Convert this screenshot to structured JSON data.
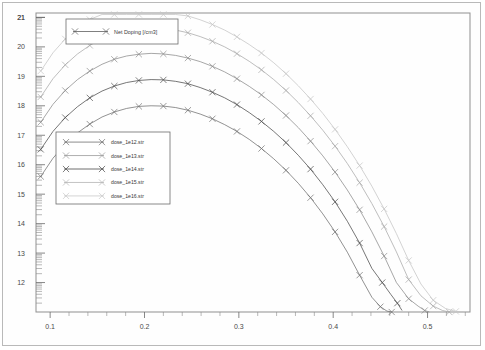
{
  "window": {
    "title": "Net Doping profile plot"
  },
  "legend_main": {
    "label": "Net Doping [/cm3]",
    "marker": "x-marker"
  },
  "legend_series": {
    "items": [
      {
        "label": "dose_1e12.str",
        "color": "#6e6e6e"
      },
      {
        "label": "dose_1e13.str",
        "color": "#9a9a9a"
      },
      {
        "label": "dose_1e14.str",
        "color": "#4a4a4a"
      },
      {
        "label": "dose_1e15.str",
        "color": "#b5b5b5"
      },
      {
        "label": "dose_1e16.str",
        "color": "#c9c9c9"
      }
    ]
  },
  "chart_data": {
    "type": "line",
    "title": "",
    "subtitle": "",
    "xlabel": "",
    "ylabel": "",
    "legend_title": "Net Doping [/cm3]",
    "legend_position": "upper-left-and-mid-left",
    "grid": false,
    "yscale": "log10-decades",
    "xlim": [
      0.085,
      0.545
    ],
    "ylim": [
      11.0,
      21.15
    ],
    "xticks": [
      0.1,
      0.2,
      0.3,
      0.4,
      0.5
    ],
    "xtick_labels": [
      "0.1",
      "0.2",
      "0.3",
      "0.4",
      "0.5"
    ],
    "yticks": [
      12,
      13,
      14,
      15,
      16,
      17,
      18,
      19,
      20,
      21
    ],
    "ytick_labels": [
      "12",
      "13",
      "14",
      "15",
      "16",
      "17",
      "18",
      "19",
      "20",
      "21"
    ],
    "marker": "x",
    "series": [
      {
        "name": "dose_1e12.str",
        "color": "#4a4a4a",
        "x": [
          0.09,
          0.103,
          0.116,
          0.129,
          0.142,
          0.155,
          0.168,
          0.181,
          0.194,
          0.207,
          0.22,
          0.233,
          0.246,
          0.259,
          0.272,
          0.285,
          0.298,
          0.311,
          0.324,
          0.337,
          0.35,
          0.363,
          0.376,
          0.389,
          0.402,
          0.415,
          0.428,
          0.441,
          0.452,
          0.461,
          0.468,
          0.473
        ],
        "y": [
          16.52,
          17.13,
          17.6,
          17.97,
          18.27,
          18.5,
          18.67,
          18.79,
          18.86,
          18.89,
          18.88,
          18.83,
          18.75,
          18.62,
          18.46,
          18.27,
          18.04,
          17.77,
          17.47,
          17.13,
          16.75,
          16.32,
          15.85,
          15.32,
          14.74,
          14.08,
          13.34,
          12.48,
          12.0,
          11.6,
          11.3,
          11.05
        ]
      },
      {
        "name": "dose_1e13.str",
        "color": "#6e6e6e",
        "x": [
          0.09,
          0.103,
          0.116,
          0.129,
          0.142,
          0.155,
          0.168,
          0.181,
          0.194,
          0.207,
          0.22,
          0.233,
          0.246,
          0.259,
          0.272,
          0.285,
          0.298,
          0.311,
          0.324,
          0.337,
          0.35,
          0.363,
          0.376,
          0.389,
          0.402,
          0.415,
          0.428,
          0.441,
          0.45,
          0.457,
          0.462
        ],
        "y": [
          15.6,
          16.22,
          16.7,
          17.08,
          17.38,
          17.62,
          17.79,
          17.91,
          17.98,
          18.0,
          17.99,
          17.94,
          17.85,
          17.72,
          17.56,
          17.36,
          17.13,
          16.86,
          16.55,
          16.2,
          15.81,
          15.37,
          14.88,
          14.33,
          13.72,
          13.03,
          12.25,
          11.5,
          11.18,
          11.03,
          11.0
        ]
      },
      {
        "name": "dose_1e14.str",
        "color": "#8a8a8a",
        "x": [
          0.09,
          0.103,
          0.116,
          0.129,
          0.142,
          0.155,
          0.168,
          0.181,
          0.194,
          0.207,
          0.22,
          0.233,
          0.246,
          0.259,
          0.272,
          0.285,
          0.298,
          0.311,
          0.324,
          0.337,
          0.35,
          0.363,
          0.376,
          0.389,
          0.402,
          0.415,
          0.428,
          0.441,
          0.454,
          0.467,
          0.48,
          0.49,
          0.497,
          0.502
        ],
        "y": [
          17.44,
          18.05,
          18.52,
          18.89,
          19.18,
          19.41,
          19.58,
          19.69,
          19.75,
          19.78,
          19.76,
          19.71,
          19.62,
          19.5,
          19.34,
          19.15,
          18.92,
          18.66,
          18.37,
          18.04,
          17.67,
          17.26,
          16.8,
          16.3,
          15.75,
          15.14,
          14.47,
          13.72,
          12.9,
          12.0,
          11.45,
          11.2,
          11.05,
          11.0
        ]
      },
      {
        "name": "dose_1e15.str",
        "color": "#a8a8a8",
        "x": [
          0.09,
          0.103,
          0.116,
          0.129,
          0.142,
          0.155,
          0.168,
          0.181,
          0.194,
          0.207,
          0.22,
          0.233,
          0.246,
          0.259,
          0.272,
          0.285,
          0.298,
          0.311,
          0.324,
          0.337,
          0.35,
          0.363,
          0.376,
          0.389,
          0.402,
          0.415,
          0.428,
          0.441,
          0.454,
          0.467,
          0.48,
          0.493,
          0.506,
          0.516,
          0.523
        ],
        "y": [
          18.3,
          18.92,
          19.39,
          19.76,
          20.05,
          20.28,
          20.45,
          20.56,
          20.62,
          20.64,
          20.62,
          20.57,
          20.48,
          20.35,
          20.19,
          20.0,
          19.77,
          19.51,
          19.22,
          18.89,
          18.52,
          18.11,
          17.66,
          17.17,
          16.63,
          16.04,
          15.39,
          14.68,
          13.9,
          13.04,
          12.1,
          11.55,
          11.2,
          11.05,
          11.0
        ]
      },
      {
        "name": "dose_1e16.str",
        "color": "#c4c4c4",
        "x": [
          0.09,
          0.103,
          0.116,
          0.129,
          0.142,
          0.155,
          0.168,
          0.181,
          0.194,
          0.207,
          0.22,
          0.233,
          0.246,
          0.259,
          0.272,
          0.285,
          0.298,
          0.311,
          0.324,
          0.337,
          0.35,
          0.363,
          0.376,
          0.389,
          0.402,
          0.415,
          0.428,
          0.441,
          0.454,
          0.467,
          0.48,
          0.493,
          0.506,
          0.519,
          0.53,
          0.538
        ],
        "y": [
          19.18,
          19.8,
          20.27,
          20.64,
          20.93,
          21.1,
          21.1,
          21.1,
          21.1,
          21.1,
          21.1,
          21.1,
          21.05,
          20.92,
          20.76,
          20.57,
          20.34,
          20.08,
          19.79,
          19.46,
          19.09,
          18.68,
          18.23,
          17.74,
          17.2,
          16.61,
          15.97,
          15.27,
          14.5,
          13.66,
          12.75,
          11.95,
          11.4,
          11.12,
          11.02,
          11.0
        ]
      }
    ]
  }
}
